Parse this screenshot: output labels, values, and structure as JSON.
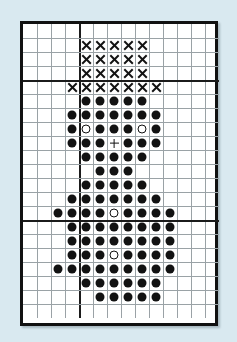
{
  "figure": {
    "title": "",
    "background_color": "#d9e9f0",
    "plot_background_color": "#ffffff",
    "border_color": "#111111",
    "grid_line_color": "#9aa2a6",
    "heavy_line_color": "#1b1b1b",
    "mark_color": "#121212"
  },
  "chart_data": {
    "type": "scatter",
    "title": "",
    "subtitle": "",
    "xlabel": "",
    "ylabel": "",
    "grid": true,
    "legend_position": "none",
    "axis_ranges": {
      "xlim": [
        0,
        14
      ],
      "ylim": [
        0,
        21
      ]
    },
    "layout": {
      "columns": 14,
      "rows": 21,
      "cell_size_px": 14,
      "heavy_vertical_lines_after_column": [
        4
      ],
      "heavy_horizontal_lines_after_row": [
        4,
        14
      ]
    },
    "symbols": {
      "x": "cross-mark",
      "filled": "filled-dot",
      "open": "open-circle",
      "plus": "plus-mark"
    },
    "series": [
      {
        "name": "cross-marks",
        "symbol": "x",
        "points": [
          {
            "col": 4,
            "row": 1
          },
          {
            "col": 5,
            "row": 1
          },
          {
            "col": 6,
            "row": 1
          },
          {
            "col": 7,
            "row": 1
          },
          {
            "col": 8,
            "row": 1
          },
          {
            "col": 4,
            "row": 2
          },
          {
            "col": 5,
            "row": 2
          },
          {
            "col": 6,
            "row": 2
          },
          {
            "col": 7,
            "row": 2
          },
          {
            "col": 8,
            "row": 2
          },
          {
            "col": 4,
            "row": 3
          },
          {
            "col": 5,
            "row": 3
          },
          {
            "col": 6,
            "row": 3
          },
          {
            "col": 7,
            "row": 3
          },
          {
            "col": 8,
            "row": 3
          },
          {
            "col": 3,
            "row": 4
          },
          {
            "col": 4,
            "row": 4
          },
          {
            "col": 5,
            "row": 4
          },
          {
            "col": 6,
            "row": 4
          },
          {
            "col": 7,
            "row": 4
          },
          {
            "col": 8,
            "row": 4
          },
          {
            "col": 9,
            "row": 4
          }
        ]
      },
      {
        "name": "filled-dots",
        "symbol": "filled",
        "points": [
          {
            "col": 4,
            "row": 5
          },
          {
            "col": 5,
            "row": 5
          },
          {
            "col": 6,
            "row": 5
          },
          {
            "col": 7,
            "row": 5
          },
          {
            "col": 8,
            "row": 5
          },
          {
            "col": 3,
            "row": 6
          },
          {
            "col": 4,
            "row": 6
          },
          {
            "col": 5,
            "row": 6
          },
          {
            "col": 6,
            "row": 6
          },
          {
            "col": 7,
            "row": 6
          },
          {
            "col": 8,
            "row": 6
          },
          {
            "col": 9,
            "row": 6
          },
          {
            "col": 3,
            "row": 7
          },
          {
            "col": 5,
            "row": 7
          },
          {
            "col": 6,
            "row": 7
          },
          {
            "col": 7,
            "row": 7
          },
          {
            "col": 9,
            "row": 7
          },
          {
            "col": 3,
            "row": 8
          },
          {
            "col": 4,
            "row": 8
          },
          {
            "col": 5,
            "row": 8
          },
          {
            "col": 7,
            "row": 8
          },
          {
            "col": 8,
            "row": 8
          },
          {
            "col": 9,
            "row": 8
          },
          {
            "col": 4,
            "row": 9
          },
          {
            "col": 5,
            "row": 9
          },
          {
            "col": 6,
            "row": 9
          },
          {
            "col": 7,
            "row": 9
          },
          {
            "col": 8,
            "row": 9
          },
          {
            "col": 5,
            "row": 10
          },
          {
            "col": 6,
            "row": 10
          },
          {
            "col": 7,
            "row": 10
          },
          {
            "col": 4,
            "row": 11
          },
          {
            "col": 5,
            "row": 11
          },
          {
            "col": 6,
            "row": 11
          },
          {
            "col": 7,
            "row": 11
          },
          {
            "col": 8,
            "row": 11
          },
          {
            "col": 3,
            "row": 12
          },
          {
            "col": 4,
            "row": 12
          },
          {
            "col": 5,
            "row": 12
          },
          {
            "col": 6,
            "row": 12
          },
          {
            "col": 7,
            "row": 12
          },
          {
            "col": 8,
            "row": 12
          },
          {
            "col": 9,
            "row": 12
          },
          {
            "col": 2,
            "row": 13
          },
          {
            "col": 3,
            "row": 13
          },
          {
            "col": 4,
            "row": 13
          },
          {
            "col": 5,
            "row": 13
          },
          {
            "col": 7,
            "row": 13
          },
          {
            "col": 8,
            "row": 13
          },
          {
            "col": 9,
            "row": 13
          },
          {
            "col": 10,
            "row": 13
          },
          {
            "col": 3,
            "row": 14
          },
          {
            "col": 4,
            "row": 14
          },
          {
            "col": 5,
            "row": 14
          },
          {
            "col": 6,
            "row": 14
          },
          {
            "col": 7,
            "row": 14
          },
          {
            "col": 8,
            "row": 14
          },
          {
            "col": 9,
            "row": 14
          },
          {
            "col": 10,
            "row": 14
          },
          {
            "col": 3,
            "row": 15
          },
          {
            "col": 4,
            "row": 15
          },
          {
            "col": 5,
            "row": 15
          },
          {
            "col": 6,
            "row": 15
          },
          {
            "col": 7,
            "row": 15
          },
          {
            "col": 8,
            "row": 15
          },
          {
            "col": 9,
            "row": 15
          },
          {
            "col": 10,
            "row": 15
          },
          {
            "col": 3,
            "row": 16
          },
          {
            "col": 4,
            "row": 16
          },
          {
            "col": 5,
            "row": 16
          },
          {
            "col": 7,
            "row": 16
          },
          {
            "col": 8,
            "row": 16
          },
          {
            "col": 9,
            "row": 16
          },
          {
            "col": 10,
            "row": 16
          },
          {
            "col": 2,
            "row": 17
          },
          {
            "col": 3,
            "row": 17
          },
          {
            "col": 4,
            "row": 17
          },
          {
            "col": 5,
            "row": 17
          },
          {
            "col": 6,
            "row": 17
          },
          {
            "col": 7,
            "row": 17
          },
          {
            "col": 8,
            "row": 17
          },
          {
            "col": 9,
            "row": 17
          },
          {
            "col": 10,
            "row": 17
          },
          {
            "col": 4,
            "row": 18
          },
          {
            "col": 5,
            "row": 18
          },
          {
            "col": 6,
            "row": 18
          },
          {
            "col": 7,
            "row": 18
          },
          {
            "col": 8,
            "row": 18
          },
          {
            "col": 9,
            "row": 18
          },
          {
            "col": 5,
            "row": 19
          },
          {
            "col": 6,
            "row": 19
          },
          {
            "col": 7,
            "row": 19
          },
          {
            "col": 8,
            "row": 19
          },
          {
            "col": 9,
            "row": 19
          }
        ]
      },
      {
        "name": "open-circles",
        "symbol": "open",
        "points": [
          {
            "col": 4,
            "row": 7
          },
          {
            "col": 8,
            "row": 7
          },
          {
            "col": 6,
            "row": 13
          },
          {
            "col": 6,
            "row": 16
          }
        ]
      },
      {
        "name": "plus-marks",
        "symbol": "plus",
        "points": [
          {
            "col": 6,
            "row": 8
          }
        ]
      }
    ]
  }
}
